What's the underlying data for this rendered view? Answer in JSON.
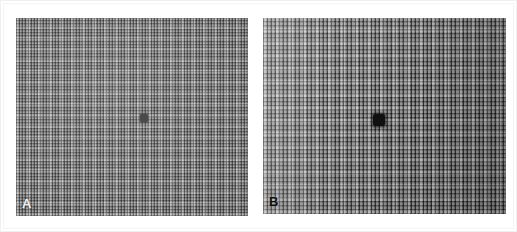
{
  "figure": {
    "type": "two-panel-micrograph",
    "width": 517,
    "height": 232,
    "mount_color": "#ffffff",
    "frame_color": "#f0f0f0"
  },
  "panels": [
    {
      "id": "A",
      "label": "A",
      "label_color": "#f2f2f2",
      "label_position": "bottom-left",
      "x": 15,
      "y": 17,
      "width": 232,
      "height": 198,
      "base_color": "#8e8e8e",
      "texture": "fine-orthogonal-mesh",
      "texture_pitch_px": 3,
      "contrast": "low",
      "brightness": "uniform-mid-gray",
      "spot": {
        "name": "central-dark-spot",
        "center_x": 143,
        "center_y": 117,
        "size_px": 8,
        "color": "#4a4a4a",
        "description": "small medium-gray square blob at center of field"
      }
    },
    {
      "id": "B",
      "label": "B",
      "label_color": "#101010",
      "label_position": "bottom-left",
      "x": 262,
      "y": 17,
      "width": 243,
      "height": 196,
      "base_color": "#7a7a7a",
      "texture": "coarse-orthogonal-mesh",
      "texture_pitch_px": 4,
      "contrast": "high",
      "brightness": "bright-left-dark-right gradient",
      "spot": {
        "name": "central-dark-spot",
        "center_x": 378,
        "center_y": 119,
        "size_px": 12,
        "color": "#101010",
        "description": "larger near-black irregular blob at center of field"
      }
    }
  ]
}
